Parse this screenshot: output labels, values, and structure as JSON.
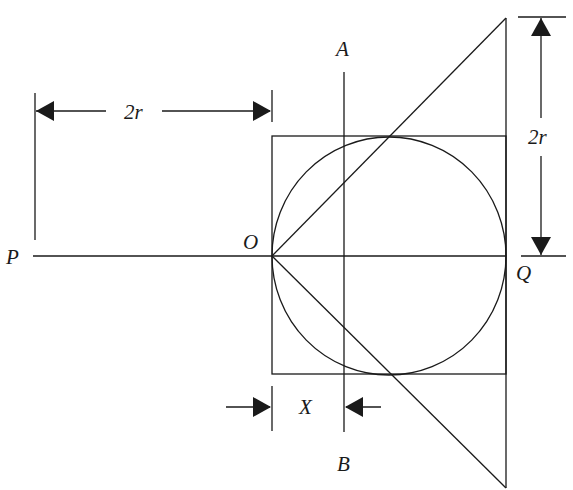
{
  "diagram": {
    "type": "geometry",
    "labels": {
      "P": "P",
      "O": "O",
      "Q": "Q",
      "A": "A",
      "B": "B",
      "X": "X",
      "dim_horizontal": "2r",
      "dim_vertical": "2r"
    },
    "elements": [
      "horizontal line P–Q through O",
      "circle tangent at O and Q inscribed in square",
      "square circumscribing circle",
      "vertical line A–B at distance X from O",
      "line from O to top of right vertical",
      "line from O to bottom of right vertical",
      "dimension 2r horizontal (left of O)",
      "dimension 2r vertical (right side)",
      "dimension X between O and line AB"
    ],
    "colors": {
      "line": "#1a1a1a",
      "background": "#ffffff"
    }
  }
}
